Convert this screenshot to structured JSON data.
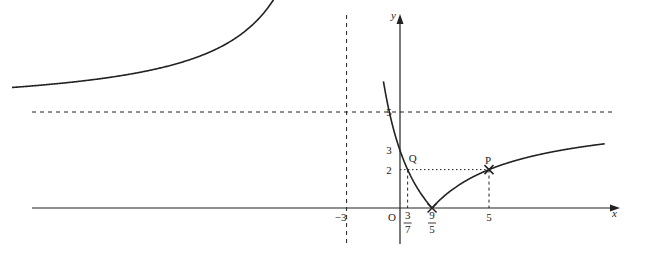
{
  "figure": {
    "function": "y = |(5x - 9)/(x + 3)|",
    "axes": {
      "x_label": "x",
      "y_label": "y",
      "origin_label": "O"
    },
    "asymptotes": {
      "vertical_x": -3,
      "horizontal_y": 5
    },
    "x_range": [
      -22,
      11.5
    ],
    "y_range": [
      -2.7,
      10.8
    ],
    "x_tick_labels": [
      {
        "value": -3,
        "text": "−3"
      },
      {
        "value": 0.428571,
        "num": "3",
        "den": "7"
      },
      {
        "value": 1.8,
        "num": "9",
        "den": "5"
      },
      {
        "value": 5,
        "text": "5"
      }
    ],
    "y_tick_labels": [
      {
        "value": 5,
        "text": "5"
      },
      {
        "value": 3,
        "text": "3"
      },
      {
        "value": 2,
        "text": "2"
      }
    ],
    "points": [
      {
        "name": "Q",
        "x": 0.428571,
        "y": 2,
        "label": "Q",
        "marker": "none"
      },
      {
        "name": "P",
        "x": 5,
        "y": 2,
        "label": "P",
        "marker": "cross"
      },
      {
        "name": "root",
        "x": 1.8,
        "y": 0,
        "label": "",
        "marker": "cross"
      }
    ],
    "colors": {
      "ink": "#222222",
      "background": "#ffffff"
    }
  }
}
